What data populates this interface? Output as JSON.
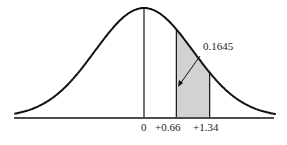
{
  "chart_data": {
    "type": "area",
    "title": "",
    "xlabel": "",
    "ylabel": "",
    "curve": "standard normal distribution",
    "tick_labels": [
      "0",
      "+0.66",
      "+1.34"
    ],
    "tick_values": [
      0,
      0.66,
      1.34
    ],
    "shaded_region": {
      "from": 0.66,
      "to": 1.34,
      "area": 0.1645
    },
    "annotation": "0.1645",
    "grid": false
  }
}
